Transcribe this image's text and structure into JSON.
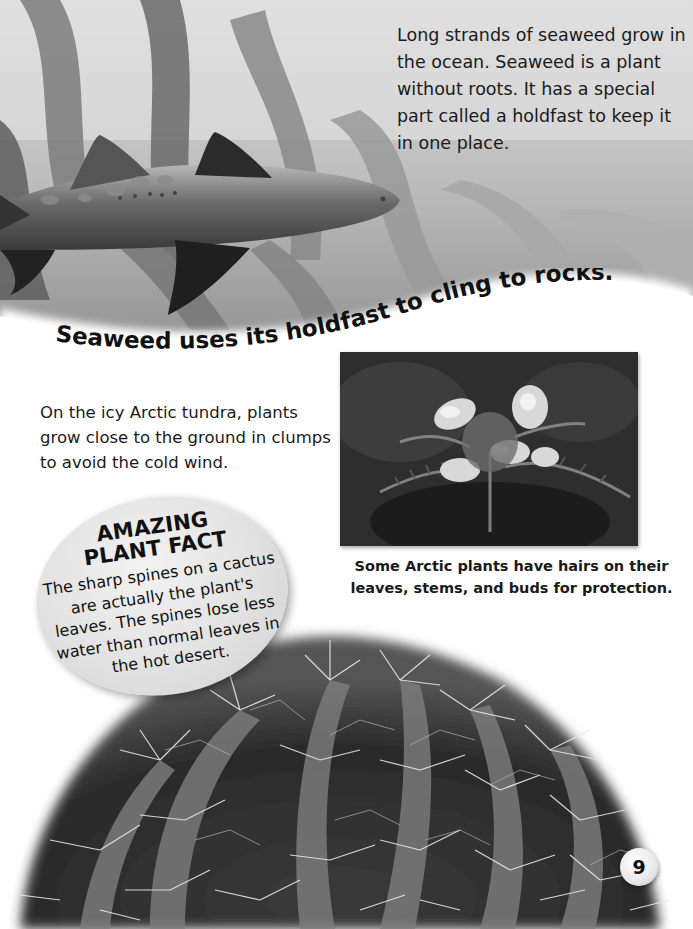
{
  "page": {
    "number": "9"
  },
  "seaweed_section": {
    "intro_text": "Long strands of seaweed grow in the ocean. Seaweed is a plant without roots. It has a special part called a holdfast to keep it in one place.",
    "photo_subject": "shark swimming among kelp seaweed",
    "curved_caption": "Seaweed uses its holdfast to cling to rocks."
  },
  "tundra_section": {
    "body_text": "On the icy Arctic tundra, plants grow close to the ground in clumps to avoid the cold wind.",
    "photo_subject": "hairy Arctic flowering plant",
    "photo_caption": "Some Arctic plants have hairs on their leaves, stems, and buds for protection."
  },
  "fact_box": {
    "title_line1": "AMAZING",
    "title_line2": "PLANT FACT",
    "body": "The sharp spines on a cactus are actually the plant's leaves. The spines lose less water than normal leaves in the hot desert."
  },
  "cactus_section": {
    "photo_subject": "spiny barrel cactus"
  }
}
